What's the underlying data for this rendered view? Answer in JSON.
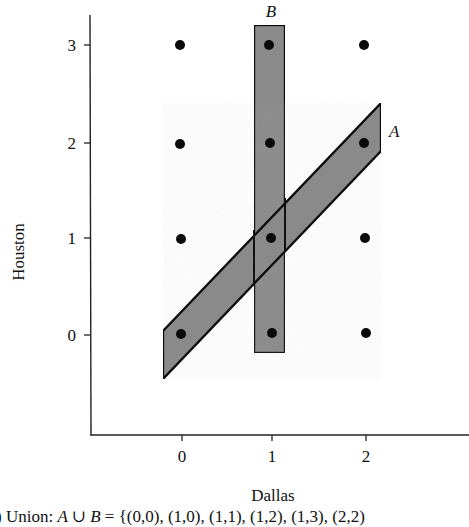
{
  "figure": {
    "x_axis": {
      "label": "Dallas",
      "ticks": [
        "0",
        "1",
        "2"
      ]
    },
    "y_axis": {
      "label": "Houston",
      "ticks": [
        "0",
        "1",
        "2",
        "3"
      ]
    },
    "sets": {
      "A": {
        "label": "A",
        "fill": "#8c8c8c",
        "stroke": "#111111",
        "points": [
          [
            0,
            0
          ],
          [
            1,
            1
          ],
          [
            2,
            2
          ]
        ]
      },
      "B": {
        "label": "B",
        "fill": "#8c8c8c",
        "stroke": "#111111",
        "points": [
          [
            1,
            0
          ],
          [
            1,
            1
          ],
          [
            1,
            2
          ],
          [
            1,
            3
          ]
        ]
      }
    },
    "grid_points": [
      [
        0,
        0
      ],
      [
        1,
        0
      ],
      [
        2,
        0
      ],
      [
        0,
        1
      ],
      [
        1,
        1
      ],
      [
        2,
        1
      ],
      [
        0,
        2
      ],
      [
        1,
        2
      ],
      [
        2,
        2
      ],
      [
        0,
        3
      ],
      [
        1,
        3
      ],
      [
        2,
        3
      ]
    ],
    "caption": {
      "prefix": ") Union: ",
      "expr": "A ∪ B",
      "equals": " = ",
      "set": "{(0,0), (1,0), (1,1), (1,2), (1,3), (2,2)"
    }
  }
}
